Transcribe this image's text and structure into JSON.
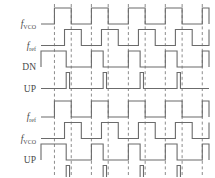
{
  "figure": {
    "width": 215,
    "height": 177,
    "background_color": "#ffffff",
    "line_color": "#6b6b6b",
    "dashed_line_color": "#8c8c8c",
    "label_color": "#4a4a4a"
  },
  "chart_data": {
    "type": "line",
    "xlabel": "",
    "ylabel": "",
    "grid": "vertical-dashed-at-vco-edges",
    "legend": "none",
    "xlim": [
      0,
      100
    ],
    "ylim": [
      0,
      1
    ],
    "panels": [
      {
        "name": "vco-leading",
        "description": "f_VCO leads f_ref, so DN pulses wide and UP emits narrow reset spikes",
        "rows": [
          {
            "label": "f_VCO",
            "label_base": "f",
            "label_sub": "VCO",
            "kind": "clock",
            "transitions": [
              0,
              8,
              18,
              30,
              40,
              52,
              62,
              74,
              84,
              96,
              100
            ],
            "start_level": 0
          },
          {
            "label": "f_ref",
            "label_base": "f",
            "label_sub": "ref",
            "kind": "clock",
            "transitions": [
              0,
              14,
              24,
              36,
              46,
              58,
              68,
              80,
              90,
              100
            ],
            "start_level": 0
          },
          {
            "label": "DN",
            "kind": "pulse",
            "pulses": [
              [
                0,
                15
              ],
              [
                30,
                37
              ],
              [
                52,
                59
              ],
              [
                74,
                81
              ],
              [
                96,
                100
              ]
            ]
          },
          {
            "label": "UP",
            "kind": "pulse",
            "pulses": [
              [
                15,
                17
              ],
              [
                37,
                39
              ],
              [
                59,
                61
              ],
              [
                81,
                83
              ]
            ]
          }
        ]
      },
      {
        "name": "ref-leading",
        "description": "f_ref leads f_VCO, so UP pulses wide and DN emits narrow reset spikes",
        "rows": [
          {
            "label": "f_ref",
            "label_base": "f",
            "label_sub": "ref",
            "kind": "clock",
            "transitions": [
              0,
              8,
              18,
              30,
              40,
              52,
              62,
              74,
              84,
              96,
              100
            ],
            "start_level": 0
          },
          {
            "label": "f_VCO",
            "label_base": "f",
            "label_sub": "VCO",
            "kind": "clock",
            "transitions": [
              0,
              14,
              24,
              36,
              46,
              58,
              68,
              80,
              90,
              100
            ],
            "start_level": 0
          },
          {
            "label": "UP",
            "kind": "pulse",
            "pulses": [
              [
                0,
                15
              ],
              [
                30,
                37
              ],
              [
                52,
                59
              ],
              [
                74,
                81
              ],
              [
                96,
                100
              ]
            ]
          },
          {
            "label": "DN",
            "kind": "pulse",
            "pulses": [
              [
                15,
                17
              ],
              [
                37,
                39
              ],
              [
                59,
                61
              ],
              [
                81,
                83
              ]
            ]
          }
        ]
      }
    ],
    "dashed_guides": [
      8,
      18,
      30,
      40,
      52,
      62,
      74,
      84,
      96
    ]
  }
}
